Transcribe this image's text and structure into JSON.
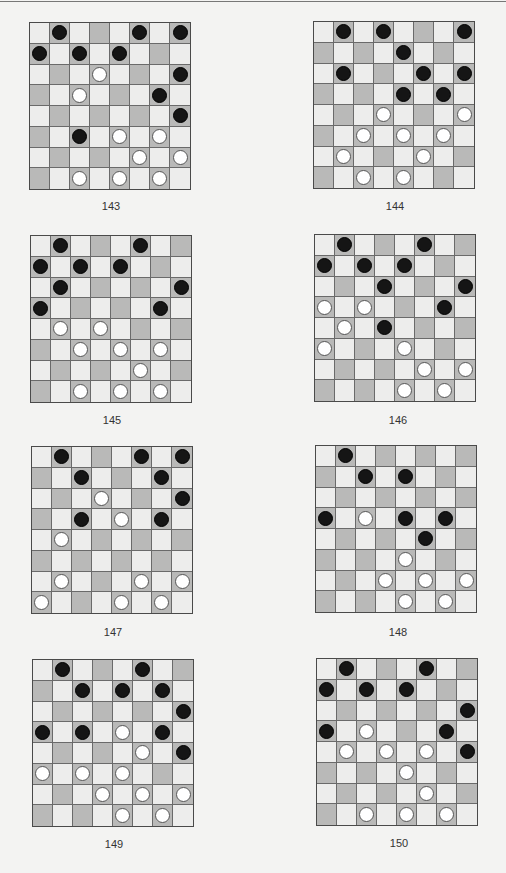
{
  "page": {
    "columns": 2,
    "rows": 4
  },
  "colors": {
    "dark_square": "#b9b9b8",
    "light_square": "#ededec",
    "black_piece": "#151515",
    "white_piece": "#ffffff",
    "grid_line": "#6a6a6a"
  },
  "puzzles": [
    {
      "number": "143",
      "pos": {
        "x": 29,
        "y": 22
      },
      "label_pos": {
        "x": 81,
        "y": 200
      },
      "black": [
        [
          0,
          1
        ],
        [
          0,
          5
        ],
        [
          0,
          7
        ],
        [
          1,
          0
        ],
        [
          1,
          2
        ],
        [
          1,
          4
        ],
        [
          2,
          7
        ],
        [
          3,
          6
        ],
        [
          4,
          7
        ],
        [
          5,
          2
        ]
      ],
      "white": [
        [
          2,
          3
        ],
        [
          3,
          2
        ],
        [
          5,
          4
        ],
        [
          5,
          6
        ],
        [
          6,
          5
        ],
        [
          6,
          7
        ],
        [
          7,
          2
        ],
        [
          7,
          4
        ],
        [
          7,
          6
        ]
      ]
    },
    {
      "number": "144",
      "pos": {
        "x": 313,
        "y": 21
      },
      "label_pos": {
        "x": 365,
        "y": 200
      },
      "black": [
        [
          0,
          1
        ],
        [
          0,
          3
        ],
        [
          0,
          7
        ],
        [
          1,
          4
        ],
        [
          2,
          1
        ],
        [
          2,
          5
        ],
        [
          2,
          7
        ],
        [
          3,
          4
        ],
        [
          3,
          6
        ]
      ],
      "white": [
        [
          4,
          3
        ],
        [
          4,
          7
        ],
        [
          5,
          2
        ],
        [
          5,
          4
        ],
        [
          5,
          6
        ],
        [
          6,
          1
        ],
        [
          6,
          5
        ],
        [
          7,
          2
        ],
        [
          7,
          4
        ]
      ]
    },
    {
      "number": "145",
      "pos": {
        "x": 30,
        "y": 235
      },
      "label_pos": {
        "x": 82,
        "y": 414
      },
      "black": [
        [
          0,
          1
        ],
        [
          0,
          5
        ],
        [
          1,
          0
        ],
        [
          1,
          2
        ],
        [
          1,
          4
        ],
        [
          2,
          1
        ],
        [
          2,
          7
        ],
        [
          3,
          0
        ],
        [
          3,
          6
        ]
      ],
      "white": [
        [
          4,
          1
        ],
        [
          4,
          3
        ],
        [
          5,
          2
        ],
        [
          5,
          4
        ],
        [
          5,
          6
        ],
        [
          6,
          5
        ],
        [
          7,
          2
        ],
        [
          7,
          4
        ],
        [
          7,
          6
        ]
      ]
    },
    {
      "number": "146",
      "pos": {
        "x": 314,
        "y": 234
      },
      "label_pos": {
        "x": 368,
        "y": 414
      },
      "black": [
        [
          0,
          1
        ],
        [
          0,
          5
        ],
        [
          1,
          0
        ],
        [
          1,
          2
        ],
        [
          1,
          4
        ],
        [
          2,
          3
        ],
        [
          2,
          7
        ],
        [
          3,
          6
        ],
        [
          4,
          3
        ]
      ],
      "white": [
        [
          3,
          0
        ],
        [
          3,
          2
        ],
        [
          4,
          1
        ],
        [
          5,
          0
        ],
        [
          5,
          4
        ],
        [
          6,
          5
        ],
        [
          6,
          7
        ],
        [
          7,
          4
        ],
        [
          7,
          6
        ]
      ]
    },
    {
      "number": "147",
      "pos": {
        "x": 31,
        "y": 446
      },
      "label_pos": {
        "x": 83,
        "y": 626
      },
      "black": [
        [
          0,
          1
        ],
        [
          0,
          5
        ],
        [
          0,
          7
        ],
        [
          1,
          2
        ],
        [
          1,
          6
        ],
        [
          2,
          7
        ],
        [
          3,
          2
        ],
        [
          3,
          6
        ]
      ],
      "white": [
        [
          2,
          3
        ],
        [
          3,
          4
        ],
        [
          4,
          1
        ],
        [
          6,
          1
        ],
        [
          6,
          5
        ],
        [
          6,
          7
        ],
        [
          7,
          0
        ],
        [
          7,
          4
        ],
        [
          7,
          6
        ]
      ]
    },
    {
      "number": "148",
      "pos": {
        "x": 315,
        "y": 445
      },
      "label_pos": {
        "x": 368,
        "y": 626
      },
      "black": [
        [
          0,
          1
        ],
        [
          1,
          2
        ],
        [
          1,
          4
        ],
        [
          3,
          0
        ],
        [
          3,
          4
        ],
        [
          3,
          6
        ],
        [
          4,
          5
        ]
      ],
      "white": [
        [
          3,
          2
        ],
        [
          5,
          4
        ],
        [
          6,
          3
        ],
        [
          6,
          5
        ],
        [
          6,
          7
        ],
        [
          7,
          4
        ],
        [
          7,
          6
        ]
      ]
    },
    {
      "number": "149",
      "pos": {
        "x": 32,
        "y": 659
      },
      "label_pos": {
        "x": 84,
        "y": 838
      },
      "black": [
        [
          0,
          1
        ],
        [
          0,
          5
        ],
        [
          1,
          2
        ],
        [
          1,
          4
        ],
        [
          1,
          6
        ],
        [
          2,
          7
        ],
        [
          3,
          0
        ],
        [
          3,
          2
        ],
        [
          3,
          6
        ],
        [
          4,
          7
        ]
      ],
      "white": [
        [
          3,
          4
        ],
        [
          4,
          5
        ],
        [
          5,
          0
        ],
        [
          5,
          2
        ],
        [
          5,
          4
        ],
        [
          6,
          3
        ],
        [
          6,
          5
        ],
        [
          6,
          7
        ],
        [
          7,
          4
        ],
        [
          7,
          6
        ]
      ]
    },
    {
      "number": "150",
      "pos": {
        "x": 316,
        "y": 658
      },
      "label_pos": {
        "x": 369,
        "y": 837
      },
      "black": [
        [
          0,
          1
        ],
        [
          0,
          5
        ],
        [
          1,
          0
        ],
        [
          1,
          2
        ],
        [
          1,
          4
        ],
        [
          2,
          7
        ],
        [
          3,
          0
        ],
        [
          3,
          6
        ],
        [
          4,
          7
        ]
      ],
      "white": [
        [
          3,
          2
        ],
        [
          4,
          1
        ],
        [
          4,
          3
        ],
        [
          4,
          5
        ],
        [
          5,
          4
        ],
        [
          6,
          5
        ],
        [
          7,
          2
        ],
        [
          7,
          4
        ],
        [
          7,
          6
        ]
      ]
    }
  ]
}
